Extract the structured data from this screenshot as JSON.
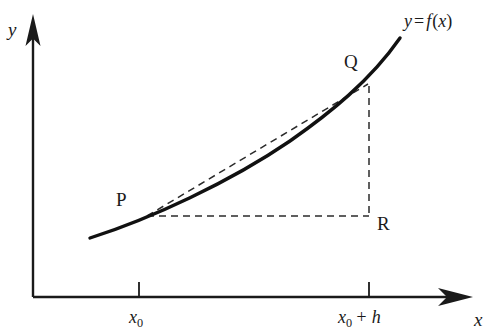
{
  "figure": {
    "background_color": "#ffffff",
    "stroke_color": "#1a1a1a",
    "width": 495,
    "height": 335
  },
  "axes": {
    "y_label": "y",
    "x_label": "x",
    "origin": {
      "x": 33,
      "y": 297
    },
    "x_axis_end": {
      "x": 472,
      "y": 297
    },
    "y_axis_end": {
      "x": 33,
      "y": 16
    },
    "arrowheads": "filled",
    "grid": false
  },
  "curve": {
    "label": "y = f(x)",
    "label_parts": {
      "y": "y",
      "equals": "=",
      "f": "f",
      "open": "(",
      "x": "x",
      "close": ")"
    },
    "style": "solid",
    "stroke_width": 3.2,
    "start": {
      "x": 90,
      "y": 238
    },
    "end": {
      "x": 400,
      "y": 38
    },
    "shape": "convex-increasing"
  },
  "points": [
    {
      "name": "P",
      "label": "P",
      "x": 146,
      "y": 216,
      "label_x": 116,
      "label_y": 190
    },
    {
      "name": "Q",
      "label": "Q",
      "x": 368,
      "y": 84,
      "label_x": 344,
      "label_y": 52
    },
    {
      "name": "R",
      "label": "R",
      "x": 369,
      "y": 216,
      "label_x": 377,
      "label_y": 214
    }
  ],
  "dashed_lines": [
    {
      "name": "secant-PQ",
      "from": "P",
      "to": "Q",
      "style": "dashed"
    },
    {
      "name": "run-PR",
      "from": "P",
      "to": "R",
      "style": "dashed"
    },
    {
      "name": "rise-QR",
      "from": "Q",
      "to": "R",
      "style": "dashed"
    }
  ],
  "x_ticks": [
    {
      "value": "x_0",
      "x": 139,
      "text_main": "x",
      "text_sub": "0",
      "text_extra": ""
    },
    {
      "value": "x_0 + h",
      "x": 369,
      "text_main": "x",
      "text_sub": "0",
      "text_extra": " + h"
    }
  ],
  "tick_labels": {
    "first": "x",
    "first_sub": "0",
    "second": "x",
    "second_sub": "0",
    "second_extra": "+ h"
  }
}
